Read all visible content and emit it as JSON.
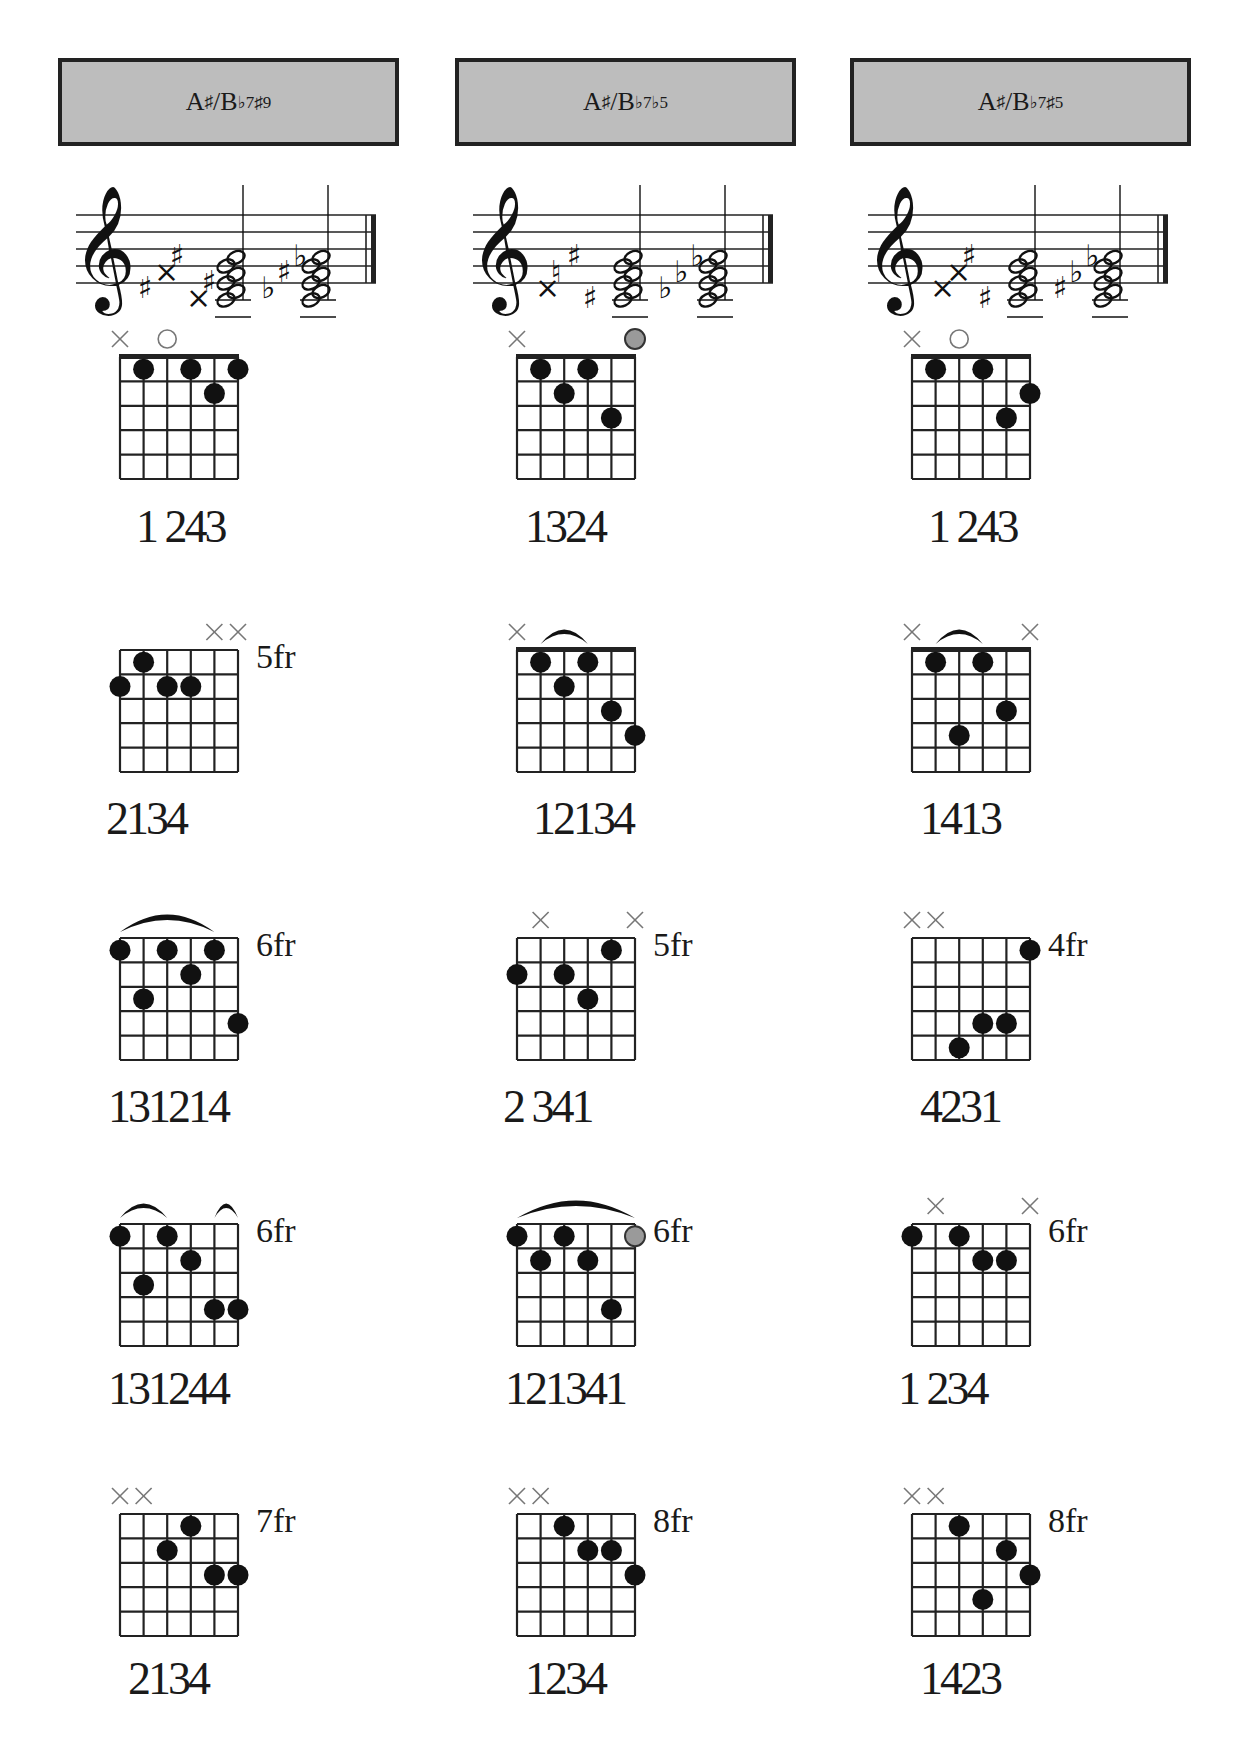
{
  "page": {
    "columns": [
      {
        "title": {
          "root": "A",
          "acc1": "♯",
          "slash": "/B",
          "ext": "♭7♯9"
        },
        "staff": {
          "clef": "treble-clef-icon",
          "chord1_accidentals": [
            "♯",
            "×",
            "♯",
            "×",
            "♯"
          ],
          "chord2_accidentals": [
            "♭",
            "♯",
            "♭"
          ]
        },
        "diagrams": [
          {
            "fret_label": "",
            "nut": true,
            "markers": [
              "x",
              "",
              "o",
              "",
              "",
              ""
            ],
            "dots": [
              [
                2,
                1
              ],
              [
                4,
                1
              ],
              [
                5,
                2
              ],
              [
                6,
                1
              ]
            ],
            "barres": [],
            "gray": [],
            "fingering": "1 243"
          },
          {
            "fret_label": "5fr",
            "nut": false,
            "markers": [
              "",
              "",
              "",
              "",
              "x",
              "x"
            ],
            "dots": [
              [
                1,
                2
              ],
              [
                2,
                1
              ],
              [
                3,
                2
              ],
              [
                4,
                2
              ]
            ],
            "barres": [],
            "gray": [],
            "fingering": "2134"
          },
          {
            "fret_label": "6fr",
            "nut": false,
            "markers": [
              "",
              "",
              "",
              "",
              "",
              ""
            ],
            "dots": [
              [
                1,
                1
              ],
              [
                3,
                1
              ],
              [
                5,
                1
              ],
              [
                2,
                3
              ],
              [
                4,
                2
              ],
              [
                6,
                4
              ]
            ],
            "barres": [
              [
                1,
                5
              ]
            ],
            "gray": [],
            "fingering": "131214"
          },
          {
            "fret_label": "6fr",
            "nut": false,
            "markers": [
              "",
              "",
              "",
              "",
              "",
              ""
            ],
            "dots": [
              [
                1,
                1
              ],
              [
                3,
                1
              ],
              [
                4,
                2
              ],
              [
                2,
                3
              ],
              [
                5,
                4
              ],
              [
                6,
                4
              ]
            ],
            "barres": [
              [
                1,
                3
              ],
              [
                5,
                6
              ]
            ],
            "gray": [],
            "fingering": "131244"
          },
          {
            "fret_label": "7fr",
            "nut": false,
            "markers": [
              "x",
              "x",
              "",
              "",
              "",
              ""
            ],
            "dots": [
              [
                4,
                1
              ],
              [
                3,
                2
              ],
              [
                5,
                3
              ],
              [
                6,
                3
              ]
            ],
            "barres": [],
            "gray": [],
            "fingering": "2134"
          }
        ]
      },
      {
        "title": {
          "root": "A",
          "acc1": "♯",
          "slash": "/B",
          "ext": "♭7♭5"
        },
        "staff": {
          "clef": "treble-clef-icon",
          "chord1_accidentals": [
            "×",
            "♮",
            "♯",
            "♯"
          ],
          "chord2_accidentals": [
            "♭",
            "♭",
            "♭"
          ]
        },
        "diagrams": [
          {
            "fret_label": "",
            "nut": true,
            "markers": [
              "x",
              "",
              "",
              "",
              "",
              "gray"
            ],
            "dots": [
              [
                2,
                1
              ],
              [
                3,
                2
              ],
              [
                4,
                1
              ],
              [
                5,
                3
              ]
            ],
            "barres": [],
            "gray": [],
            "fingering": "1324"
          },
          {
            "fret_label": "",
            "nut": true,
            "markers": [
              "x",
              "",
              "",
              "",
              "",
              ""
            ],
            "dots": [
              [
                2,
                1
              ],
              [
                3,
                2
              ],
              [
                4,
                1
              ],
              [
                5,
                3
              ],
              [
                6,
                4
              ]
            ],
            "barres": [
              [
                2,
                4
              ]
            ],
            "gray": [],
            "fingering": "12134"
          },
          {
            "fret_label": "5fr",
            "nut": false,
            "markers": [
              "",
              "x",
              "",
              "",
              "",
              "x"
            ],
            "dots": [
              [
                1,
                2
              ],
              [
                3,
                2
              ],
              [
                4,
                3
              ],
              [
                5,
                1
              ]
            ],
            "barres": [],
            "gray": [],
            "fingering": "2 341"
          },
          {
            "fret_label": "6fr",
            "nut": false,
            "markers": [
              "",
              "",
              "",
              "",
              "",
              ""
            ],
            "dots": [
              [
                1,
                1
              ],
              [
                2,
                2
              ],
              [
                3,
                1
              ],
              [
                4,
                2
              ],
              [
                5,
                4
              ]
            ],
            "barres": [
              [
                1,
                6
              ]
            ],
            "gray": [
              [
                6,
                1
              ]
            ],
            "fingering": "121341"
          },
          {
            "fret_label": "8fr",
            "nut": false,
            "markers": [
              "x",
              "x",
              "",
              "",
              "",
              ""
            ],
            "dots": [
              [
                3,
                1
              ],
              [
                4,
                2
              ],
              [
                5,
                2
              ],
              [
                6,
                3
              ]
            ],
            "barres": [],
            "gray": [],
            "fingering": "1234"
          }
        ]
      },
      {
        "title": {
          "root": "A",
          "acc1": "♯",
          "slash": "/B",
          "ext": "♭7♯5"
        },
        "staff": {
          "clef": "treble-clef-icon",
          "chord1_accidentals": [
            "×",
            "×",
            "♯",
            "♯"
          ],
          "chord2_accidentals": [
            "♯",
            "♭",
            "♭"
          ]
        },
        "diagrams": [
          {
            "fret_label": "",
            "nut": true,
            "markers": [
              "x",
              "",
              "o",
              "",
              "",
              ""
            ],
            "dots": [
              [
                2,
                1
              ],
              [
                4,
                1
              ],
              [
                5,
                3
              ],
              [
                6,
                2
              ]
            ],
            "barres": [],
            "gray": [],
            "fingering": "1 243"
          },
          {
            "fret_label": "",
            "nut": true,
            "markers": [
              "x",
              "",
              "",
              "",
              "",
              "x"
            ],
            "dots": [
              [
                2,
                1
              ],
              [
                3,
                4
              ],
              [
                4,
                1
              ],
              [
                5,
                3
              ]
            ],
            "barres": [
              [
                2,
                4
              ]
            ],
            "gray": [],
            "fingering": "1413"
          },
          {
            "fret_label": "4fr",
            "nut": false,
            "markers": [
              "x",
              "x",
              "",
              "",
              "",
              ""
            ],
            "dots": [
              [
                6,
                1
              ],
              [
                4,
                4
              ],
              [
                5,
                4
              ],
              [
                3,
                5
              ]
            ],
            "barres": [],
            "gray": [],
            "fingering": "4231"
          },
          {
            "fret_label": "6fr",
            "nut": false,
            "markers": [
              "",
              "x",
              "",
              "",
              "",
              "x"
            ],
            "dots": [
              [
                1,
                1
              ],
              [
                3,
                1
              ],
              [
                4,
                2
              ],
              [
                5,
                2
              ]
            ],
            "barres": [],
            "gray": [],
            "fingering": "1 234"
          },
          {
            "fret_label": "8fr",
            "nut": false,
            "markers": [
              "x",
              "x",
              "",
              "",
              "",
              ""
            ],
            "dots": [
              [
                3,
                1
              ],
              [
                5,
                2
              ],
              [
                6,
                3
              ],
              [
                4,
                4
              ]
            ],
            "barres": [],
            "gray": [],
            "fingering": "1423"
          }
        ]
      }
    ]
  }
}
